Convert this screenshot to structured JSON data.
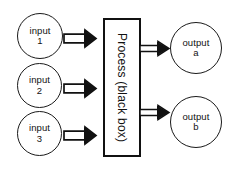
{
  "diagram": {
    "type": "block-flow",
    "background_color": "#ffffff",
    "stroke_color": "#111111",
    "inputs": [
      {
        "id": "input-1",
        "label_top": "input",
        "label_bottom": "1",
        "shape": "circle"
      },
      {
        "id": "input-2",
        "label_top": "input",
        "label_bottom": "2",
        "shape": "circle"
      },
      {
        "id": "input-3",
        "label_top": "input",
        "label_bottom": "3",
        "shape": "circle"
      }
    ],
    "process": {
      "id": "process-box",
      "label": "Process (black box)",
      "shape": "rectangle",
      "text_orientation": "vertical-rotated-90-clockwise"
    },
    "outputs": [
      {
        "id": "output-a",
        "label_top": "output",
        "label_bottom": "a",
        "shape": "circle"
      },
      {
        "id": "output-b",
        "label_top": "output",
        "label_bottom": "b",
        "shape": "circle"
      }
    ],
    "arrows": [
      {
        "id": "arrow-input-1",
        "from": "input-1",
        "to": "process-box",
        "style": "hollow-block-arrow",
        "direction": "right"
      },
      {
        "id": "arrow-input-2",
        "from": "input-2",
        "to": "process-box",
        "style": "hollow-block-arrow",
        "direction": "right"
      },
      {
        "id": "arrow-input-3",
        "from": "input-3",
        "to": "process-box",
        "style": "hollow-block-arrow",
        "direction": "right"
      },
      {
        "id": "arrow-output-a",
        "from": "process-box",
        "to": "output-a",
        "style": "hollow-block-arrow",
        "direction": "right"
      },
      {
        "id": "arrow-output-b",
        "from": "process-box",
        "to": "output-b",
        "style": "hollow-block-arrow",
        "direction": "right"
      }
    ]
  }
}
